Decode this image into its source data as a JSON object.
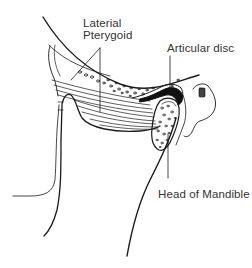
{
  "diagram": {
    "labels": {
      "lateral_pterygoid_line1": "Laterial",
      "lateral_pterygoid_line2": "Pterygoid",
      "articular_disc": "Articular disc",
      "head_of_mandible": "Head of Mandible"
    },
    "structures": [
      "temporal-bone-outline",
      "lateral-pterygoid-muscle",
      "articular-disc",
      "head-of-mandible",
      "external-ear-canal",
      "ramus-of-mandible",
      "pterygoid-plate"
    ],
    "colors": {
      "line": "#1a1a1a",
      "label_text": "#333333",
      "background": "#ffffff"
    }
  }
}
